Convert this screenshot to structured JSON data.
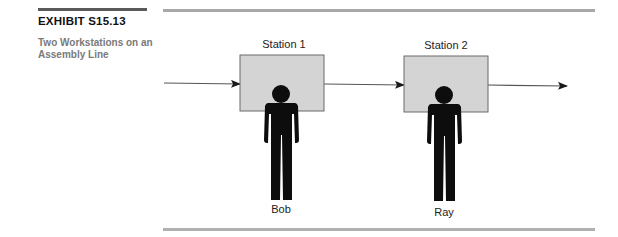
{
  "exhibit": {
    "label": "EXHIBIT S15.13",
    "caption": "Two Workstations on an Assembly Line"
  },
  "diagram": {
    "type": "process-flow",
    "colors": {
      "rule": "#a8a8a8",
      "station_fill": "#d4d4d4",
      "station_border": "#6b6b6b",
      "arrow": "#555555",
      "worker": "#0d0d0d"
    },
    "stations": [
      {
        "label": "Station 1",
        "worker": "Bob"
      },
      {
        "label": "Station 2",
        "worker": "Ray"
      }
    ],
    "flow": [
      "input",
      "Station 1",
      "Station 2",
      "output"
    ]
  }
}
